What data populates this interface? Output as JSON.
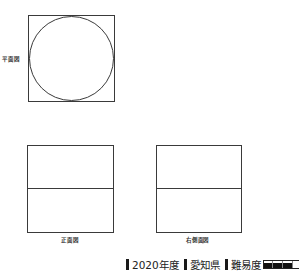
{
  "diagram": {
    "views": [
      {
        "id": "plan",
        "label": "平面図",
        "shape": "square-with-inscribed-circle"
      },
      {
        "id": "front",
        "label": "正面図",
        "shape": "rectangle-split-horizontally"
      },
      {
        "id": "right_side",
        "label": "右側面図",
        "shape": "rectangle-split-horizontally"
      }
    ]
  },
  "footer": {
    "year": "2020年度",
    "prefecture": "愛知県",
    "difficulty_label": "難易度",
    "difficulty_level": 3,
    "difficulty_max": 4
  }
}
